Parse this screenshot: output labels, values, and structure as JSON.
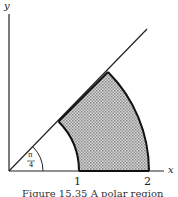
{
  "figure": {
    "axes": {
      "x_label": "x",
      "y_label": "y"
    },
    "ticks": [
      {
        "value": 1,
        "label": "1"
      },
      {
        "value": 2,
        "label": "2"
      }
    ],
    "angle_label_num": "π",
    "angle_label_den": "4",
    "region": {
      "description": "Polar region between r=1 and r=2, 0 ≤ θ ≤ π/4",
      "r_inner": 1,
      "r_outer": 2,
      "theta_start": 0,
      "theta_end": "π/4",
      "fill_color": "#b9b9b9"
    },
    "caption": "Figure 15.35  A polar region"
  }
}
